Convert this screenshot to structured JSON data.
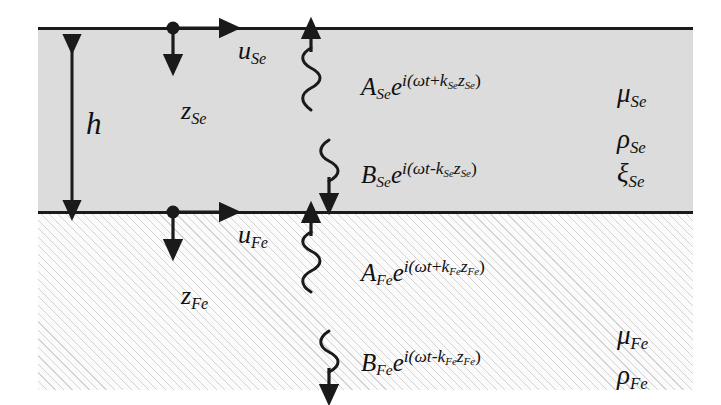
{
  "figure": {
    "colors": {
      "upper_layer_fill": "#dcdcdc",
      "lower_layer_fill": "#fbfbfb",
      "line": "#1a1a1a",
      "hatch": "#787878"
    }
  },
  "upper_layer": {
    "name": "Se",
    "thickness_label": "h",
    "coordinate_label": {
      "normal": "z",
      "normal_sub": "Se",
      "tangential": "u",
      "tangential_sub": "Se"
    },
    "upgoing_wave": {
      "amplitude": "A",
      "amplitude_sub": "Se",
      "exponent_prefix": "i(",
      "omega": "ω",
      "t": "t",
      "sign": "+",
      "k": "k",
      "k_sub": "Se",
      "z": "z",
      "z_sub": "Se",
      "exponent_suffix": ")"
    },
    "downgoing_wave": {
      "amplitude": "B",
      "amplitude_sub": "Se",
      "exponent_prefix": "i(",
      "omega": "ω",
      "t": "t",
      "sign": "-",
      "k": "k",
      "k_sub": "Se",
      "z": "z",
      "z_sub": "Se",
      "exponent_suffix": ")"
    },
    "properties": [
      {
        "symbol": "μ",
        "sub": "Se"
      },
      {
        "symbol": "ρ",
        "sub": "Se"
      },
      {
        "symbol": "ξ",
        "sub": "Se"
      }
    ]
  },
  "lower_layer": {
    "name": "Fe",
    "coordinate_label": {
      "normal": "z",
      "normal_sub": "Fe",
      "tangential": "u",
      "tangential_sub": "Fe"
    },
    "upgoing_wave": {
      "amplitude": "A",
      "amplitude_sub": "Fe",
      "exponent_prefix": "i(",
      "omega": "ω",
      "t": "t",
      "sign": "+",
      "k": "k",
      "k_sub": "Fe",
      "z": "z",
      "z_sub": "Fe",
      "exponent_suffix": ")"
    },
    "downgoing_wave": {
      "amplitude": "B",
      "amplitude_sub": "Fe",
      "exponent_prefix": "i(",
      "omega": "ω",
      "t": "t",
      "sign": "-",
      "k": "k",
      "k_sub": "Fe",
      "z": "z",
      "z_sub": "Fe",
      "exponent_suffix": ")"
    },
    "properties": [
      {
        "symbol": "μ",
        "sub": "Fe"
      },
      {
        "symbol": "ρ",
        "sub": "Fe"
      }
    ]
  },
  "base_symbol": "e",
  "exponent_e": "e"
}
